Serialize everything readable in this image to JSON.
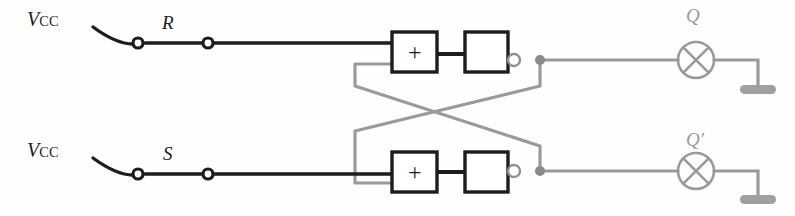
{
  "diagram": {
    "colors": {
      "wire_dark": "#1d1d1d",
      "wire_gray": "#9a9a9a",
      "ground_gray": "#a0a0a0",
      "background": "#fefefe"
    },
    "supplies": [
      {
        "name": "vcc-top",
        "symbol": "V",
        "subscript": "CC",
        "x": 27,
        "y": 8
      },
      {
        "name": "vcc-bottom",
        "symbol": "V",
        "subscript": "CC",
        "x": 27,
        "y": 139
      }
    ],
    "switches": [
      {
        "name": "switch-r",
        "label": "R",
        "contact_left_x": 138,
        "contact_right_x": 208,
        "y": 43
      },
      {
        "name": "switch-s",
        "label": "S",
        "contact_left_x": 138,
        "contact_right_x": 208,
        "y": 174
      }
    ],
    "gates": [
      {
        "name": "nor-gate-top",
        "adder_label": "+",
        "adder_box": {
          "x": 392,
          "y": 32,
          "w": 45,
          "h": 40
        },
        "buffer_box": {
          "x": 465,
          "y": 32,
          "w": 43,
          "h": 40
        },
        "output_bubble": {
          "cx": 514,
          "cy": 60,
          "r": 6
        },
        "junction": {
          "cx": 540,
          "cy": 60,
          "r": 5
        }
      },
      {
        "name": "nor-gate-bottom",
        "adder_label": "+",
        "adder_box": {
          "x": 392,
          "y": 152,
          "w": 45,
          "h": 40
        },
        "buffer_box": {
          "x": 465,
          "y": 152,
          "w": 43,
          "h": 40
        },
        "output_bubble": {
          "cx": 514,
          "cy": 171,
          "r": 6
        },
        "junction": {
          "cx": 540,
          "cy": 171,
          "r": 5
        }
      }
    ],
    "outputs": [
      {
        "name": "output-q",
        "label": "Q",
        "lamp": {
          "cx": 696,
          "cy": 60,
          "r": 18
        },
        "ground": {
          "x": 740,
          "y": 86,
          "w": 36,
          "h": 8
        }
      },
      {
        "name": "output-q-prime",
        "label": "Q′",
        "lamp": {
          "cx": 696,
          "cy": 171,
          "r": 18
        },
        "ground": {
          "x": 740,
          "y": 196,
          "w": 36,
          "h": 8
        }
      }
    ],
    "feedback": {
      "name": "cross-coupled-feedback",
      "crossing_point": {
        "x": 411,
        "y": 108
      },
      "left_rail_x": 355,
      "right_rail_x": 540
    }
  }
}
